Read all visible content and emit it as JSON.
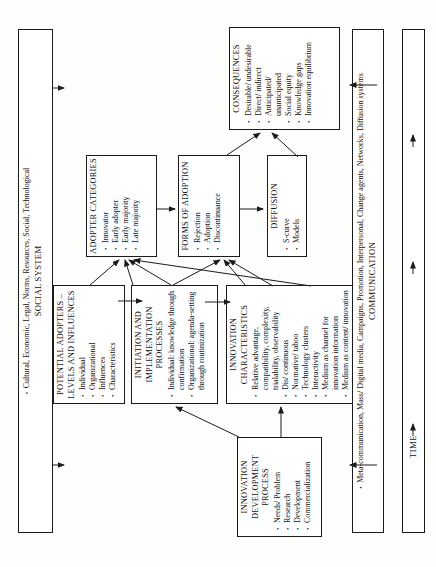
{
  "colors": {
    "ink": "#111111",
    "line": "#1b1b1b",
    "background": "#ffffff"
  },
  "bars": {
    "social_system": {
      "title": "SOCIAL SYSTEM",
      "items": [
        "Cultural, Economic, Legal, Norms, Resources, Social, Technological"
      ]
    },
    "communication": {
      "title": "COMMUNICATION",
      "items": [
        "Meta-communication, Mass/ Digital media, Campaigns, Promotion, Interpersonal, Change agents, Networks, Diffusion systems"
      ]
    },
    "time": {
      "label": "TIME"
    }
  },
  "boxes": {
    "innovation_development": {
      "title": "INNOVATION DEVELOPMENT PROCESS",
      "items": [
        "Needs/ Problem",
        "Research",
        "Development",
        "Commercialization"
      ]
    },
    "potential_adopters": {
      "title": "POTENTIAL ADOPTERS – LEVELS AND INFLUENCES",
      "items": [
        "Individual",
        "Organizational",
        "Influences",
        "Characteristics"
      ]
    },
    "initiation": {
      "title": "INITIATION AND IMPLEMENTATION PROCESSES",
      "items": [
        "Individual: knowledge through confirmation",
        "Organizational: agenda-setting through routinization"
      ]
    },
    "innovation_characteristics": {
      "title": "INNOVATION CHARACTERISTICS",
      "items": [
        "Relative advantage, compatibility, complexity, trialability, observability",
        "Dis/ continuous",
        "Normative/ taboo",
        "Technology clusters",
        "Interactivity",
        "Medium as channel for innovation information",
        "Medium as content/ innovation to be adopted"
      ]
    },
    "adopter_categories": {
      "title": "ADOPTER CATEGORIES",
      "items": [
        "Innovator",
        "Early adopter",
        "Early majority",
        "Late majority"
      ]
    },
    "forms_of_adoption": {
      "title": "FORMS OF ADOPTION",
      "items": [
        "Rejection",
        "Adoption",
        "Discontinuance"
      ]
    },
    "diffusion": {
      "title": "DIFFUSION",
      "items": [
        "S-curve",
        "Models"
      ]
    },
    "consequences": {
      "title": "CONSEQUENCES",
      "items": [
        "Desirable/ undesirable",
        "Direct/ indirect",
        "Anticipated/ unanticipated",
        "Social equity",
        "Knowledge gaps",
        "Innovation equilibrium"
      ]
    }
  }
}
